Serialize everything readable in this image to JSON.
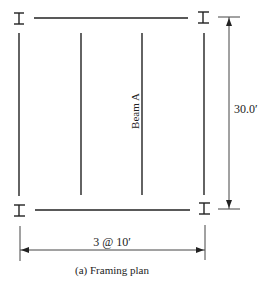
{
  "diagram": {
    "caption": "(a) Framing plan",
    "labels": {
      "beam": "Beam A",
      "vertical_dimension": "30.0′",
      "horizontal_dimension": "3 @ 10′"
    },
    "colors": {
      "line": "#222222",
      "dimension": "#444444"
    }
  }
}
